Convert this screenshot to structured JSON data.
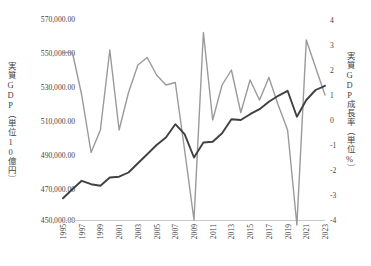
{
  "axes": {
    "left_title": "実質GDP（単位10億円）",
    "right_title": "実質GDP成長率（単位%）",
    "left_ticks": [
      "570,000.00",
      "550,000.00",
      "530,000.00",
      "510,000.00",
      "490,000.00",
      "470,000.00",
      "450,000.00"
    ],
    "right_ticks": [
      "4",
      "3",
      "2",
      "1",
      "0",
      "-1",
      "-2",
      "-3",
      "-4"
    ],
    "x_ticks": [
      "1995",
      "1997",
      "1999",
      "2001",
      "2003",
      "2005",
      "2007",
      "2009",
      "2011",
      "2013",
      "2015",
      "2017",
      "2019",
      "2021",
      "2023"
    ]
  },
  "colors": {
    "gdp_line": "#404040",
    "growth_line": "#9a9a9a",
    "axis": "#c9c9c9",
    "text": "#3f3f3f"
  },
  "chart_data": {
    "type": "line",
    "title": "",
    "xlabel": "",
    "grid": false,
    "legend": "none",
    "x": [
      1995,
      1996,
      1997,
      1998,
      1999,
      2000,
      2001,
      2002,
      2003,
      2004,
      2005,
      2006,
      2007,
      2008,
      2009,
      2010,
      2011,
      2012,
      2013,
      2014,
      2015,
      2016,
      2017,
      2018,
      2019,
      2020,
      2021,
      2022,
      2023
    ],
    "axis_left": {
      "label": "実質GDP（単位10億円）",
      "unit": "10億円",
      "min": 450000,
      "max": 570000,
      "step": 20000
    },
    "axis_right": {
      "label": "実質GDP成長率（単位%）",
      "unit": "%",
      "min": -4,
      "max": 4,
      "step": 1
    },
    "series": [
      {
        "name": "実質GDP",
        "axis": "left",
        "color": "#404040",
        "values": [
          463000,
          468500,
          473500,
          471500,
          470500,
          475500,
          476000,
          478500,
          484000,
          489500,
          495000,
          499500,
          507500,
          501500,
          487500,
          496500,
          497000,
          502000,
          510500,
          510000,
          513500,
          516500,
          521000,
          524500,
          527500,
          512000,
          522000,
          528000,
          530500
        ]
      },
      {
        "name": "実質GDP成長率",
        "axis": "right",
        "color": "#9a9a9a",
        "values": [
          2.7,
          2.7,
          1.0,
          -1.3,
          -0.4,
          2.8,
          -0.4,
          1.1,
          2.2,
          2.5,
          1.8,
          1.4,
          1.5,
          -1.2,
          -4.0,
          3.5,
          0.0,
          1.4,
          2.0,
          0.3,
          1.6,
          0.8,
          1.7,
          0.6,
          -0.4,
          -4.2,
          3.2,
          2.1,
          1.0
        ]
      }
    ]
  }
}
